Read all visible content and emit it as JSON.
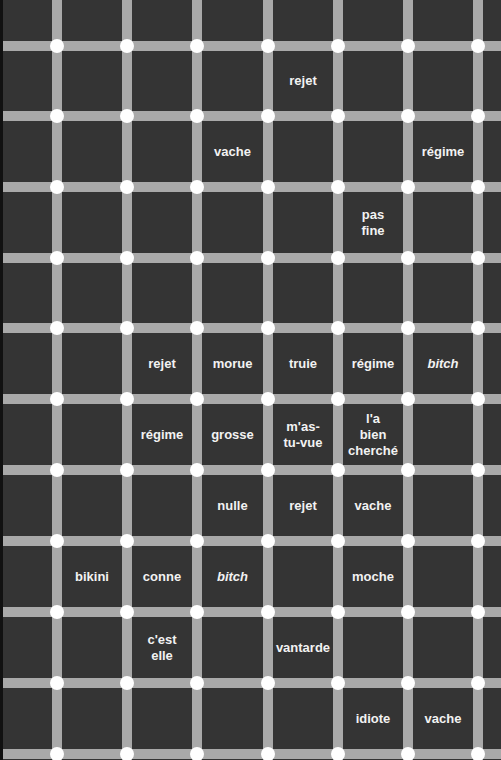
{
  "colors": {
    "background": "#343434",
    "grid_line": "#a9a9a9",
    "dot": "#ffffff",
    "text": "#f2f2f2"
  },
  "grid": {
    "vertical_lines_x": [
      57,
      127,
      197,
      268,
      338,
      408,
      478
    ],
    "horizontal_lines_y": [
      46,
      116,
      187,
      258,
      328,
      399,
      470,
      541,
      612,
      683,
      754
    ],
    "line_width": 10
  },
  "words": [
    {
      "text": "rejet",
      "col": 4,
      "row": 1,
      "italic": false
    },
    {
      "text": "vache",
      "col": 3,
      "row": 2,
      "italic": false
    },
    {
      "text": "régime",
      "col": 6,
      "row": 2,
      "italic": false
    },
    {
      "text": "pas\nfine",
      "col": 5,
      "row": 3,
      "italic": false
    },
    {
      "text": "rejet",
      "col": 2,
      "row": 5,
      "italic": false
    },
    {
      "text": "morue",
      "col": 3,
      "row": 5,
      "italic": false
    },
    {
      "text": "truie",
      "col": 4,
      "row": 5,
      "italic": false
    },
    {
      "text": "régime",
      "col": 5,
      "row": 5,
      "italic": false
    },
    {
      "text": "bitch",
      "col": 6,
      "row": 5,
      "italic": true
    },
    {
      "text": "régime",
      "col": 2,
      "row": 6,
      "italic": false
    },
    {
      "text": "grosse",
      "col": 3,
      "row": 6,
      "italic": false
    },
    {
      "text": "m'as-\ntu-vue",
      "col": 4,
      "row": 6,
      "italic": false
    },
    {
      "text": "l'a\nbien\ncherché",
      "col": 5,
      "row": 6,
      "italic": false
    },
    {
      "text": "nulle",
      "col": 3,
      "row": 7,
      "italic": false
    },
    {
      "text": "rejet",
      "col": 4,
      "row": 7,
      "italic": false
    },
    {
      "text": "vache",
      "col": 5,
      "row": 7,
      "italic": false
    },
    {
      "text": "bikini",
      "col": 1,
      "row": 8,
      "italic": false
    },
    {
      "text": "conne",
      "col": 2,
      "row": 8,
      "italic": false
    },
    {
      "text": "bitch",
      "col": 3,
      "row": 8,
      "italic": true
    },
    {
      "text": "moche",
      "col": 5,
      "row": 8,
      "italic": false
    },
    {
      "text": "c'est\nelle",
      "col": 2,
      "row": 9,
      "italic": false
    },
    {
      "text": "vantarde",
      "col": 4,
      "row": 9,
      "italic": false
    },
    {
      "text": "idiote",
      "col": 5,
      "row": 10,
      "italic": false
    },
    {
      "text": "vache",
      "col": 6,
      "row": 10,
      "italic": false
    }
  ]
}
